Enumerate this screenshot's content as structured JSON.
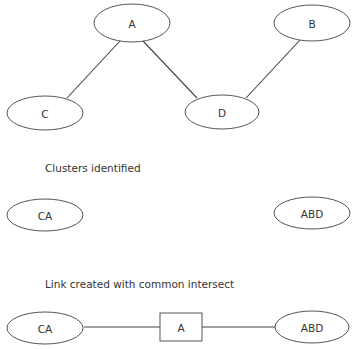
{
  "graph": {
    "nodes": [
      {
        "id": "A",
        "label": "A",
        "cx": 132,
        "cy": 23,
        "rx": 38,
        "ry": 19
      },
      {
        "id": "B",
        "label": "B",
        "cx": 312,
        "cy": 23,
        "rx": 38,
        "ry": 18
      },
      {
        "id": "C",
        "label": "C",
        "cx": 45,
        "cy": 113,
        "rx": 38,
        "ry": 17
      },
      {
        "id": "D",
        "label": "D",
        "cx": 222,
        "cy": 112,
        "rx": 37,
        "ry": 17
      }
    ],
    "edges": [
      {
        "from": "A",
        "to": "C"
      },
      {
        "from": "A",
        "to": "D"
      },
      {
        "from": "B",
        "to": "D"
      }
    ]
  },
  "clusters": {
    "caption": "Clusters identified",
    "nodes": [
      {
        "id": "CA",
        "label": "CA"
      },
      {
        "id": "ABD",
        "label": "ABD"
      }
    ]
  },
  "link": {
    "caption": "Link created with common intersect",
    "left": {
      "label": "CA"
    },
    "intersect": {
      "label": "A"
    },
    "right": {
      "label": "ABD"
    }
  }
}
